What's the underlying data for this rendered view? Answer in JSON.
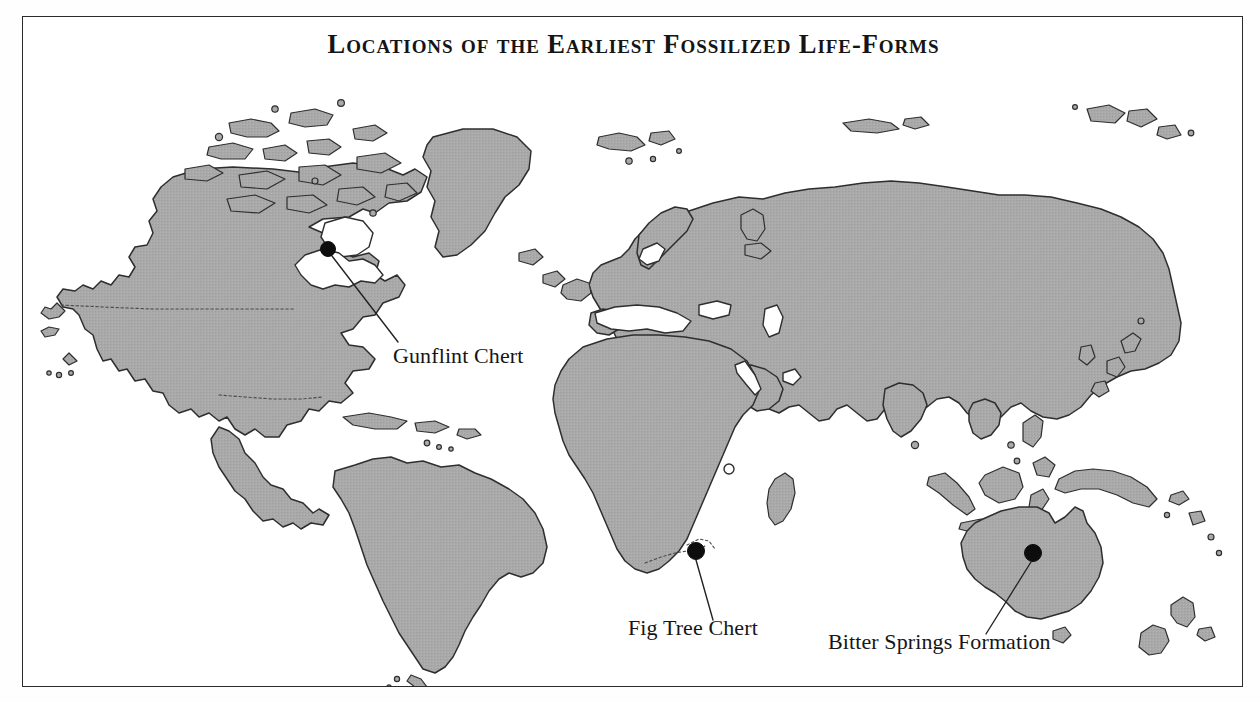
{
  "figure": {
    "title": "Locations of the Earliest Fossilized Life-Forms",
    "frame_color": "#2b2b2b",
    "background_color": "#ffffff",
    "land_fill_color": "#a8a8a8",
    "land_outline_color": "#2e2e2e",
    "marker_color": "#0d0d0d",
    "projection_note": "world map, equirectangular-style, Antarctica omitted"
  },
  "sites": [
    {
      "id": "gunflint-chert",
      "label": "Gunflint Chert",
      "marker": {
        "x": 305,
        "y": 232,
        "r": 7.5
      },
      "leader": {
        "x1": 309,
        "y1": 239,
        "x2": 375,
        "y2": 325
      },
      "label_pos": {
        "x": 370,
        "y": 346
      },
      "region": "North America - Lake Superior, Canada"
    },
    {
      "id": "fig-tree-chert",
      "label": "Fig Tree Chert",
      "marker": {
        "x": 673,
        "y": 534,
        "r": 8.5
      },
      "leader": {
        "x1": 673,
        "y1": 543,
        "x2": 690,
        "y2": 603
      },
      "label_pos": {
        "x": 605,
        "y": 618
      },
      "region": "Southern Africa - Barberton, South Africa"
    },
    {
      "id": "bitter-springs-formation",
      "label": "Bitter Springs Formation",
      "marker": {
        "x": 1010,
        "y": 536,
        "r": 8.5
      },
      "leader": {
        "x1": 1008,
        "y1": 545,
        "x2": 963,
        "y2": 617
      },
      "label_pos": {
        "x": 805,
        "y": 632
      },
      "region": "Central Australia"
    }
  ],
  "map_features": {
    "landmasses": [
      "North America",
      "Greenland",
      "Canadian Arctic Archipelago",
      "South America",
      "Caribbean islands",
      "Europe",
      "Africa",
      "Madagascar",
      "Asia",
      "Arabian Peninsula",
      "India",
      "Japan",
      "Southeast Asian islands",
      "Philippines",
      "Borneo",
      "Sumatra",
      "Java",
      "New Guinea",
      "Australia",
      "Tasmania",
      "New Zealand",
      "Iceland",
      "British Isles",
      "Svalbard",
      "Novaya Zemlya",
      "Sri Lanka"
    ],
    "inland_waters": [
      "Great Lakes",
      "Hudson Bay",
      "Mediterranean Sea",
      "Black Sea",
      "Caspian Sea",
      "Baltic Sea",
      "Red Sea",
      "Persian Gulf",
      "Lake Victoria"
    ],
    "dotted_boundaries": [
      "United States - Canada border",
      "United States - Mexico border",
      "South Africa internal boundary"
    ]
  }
}
